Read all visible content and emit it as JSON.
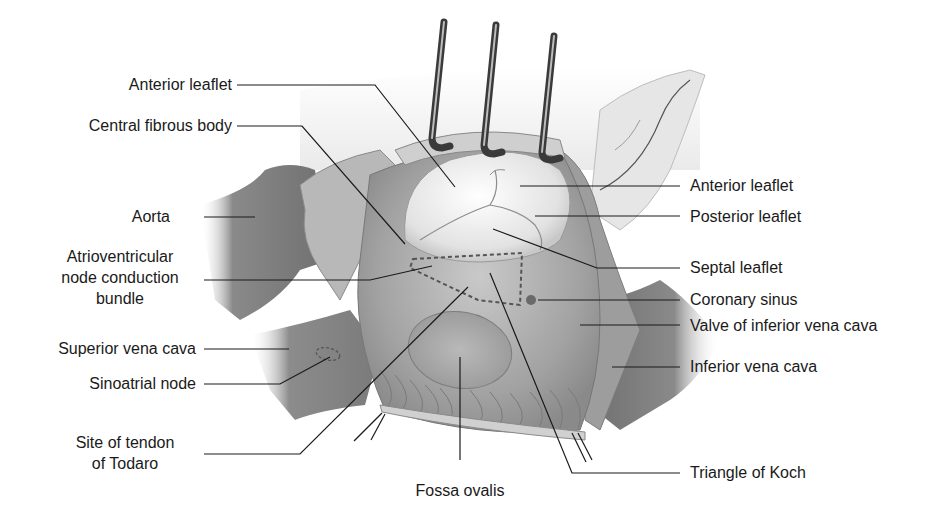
{
  "figure": {
    "labels_left": [
      {
        "id": "anterior-leaflet-left",
        "text": "Anterior leaflet"
      },
      {
        "id": "central-fibrous-body",
        "text": "Central fibrous body"
      },
      {
        "id": "aorta",
        "text": "Aorta"
      },
      {
        "id": "av-node",
        "lines": [
          "Atrioventricular",
          "node conduction",
          "bundle"
        ]
      },
      {
        "id": "superior-vena-cava",
        "text": "Superior vena cava"
      },
      {
        "id": "sinoatrial-node",
        "text": "Sinoatrial node"
      },
      {
        "id": "tendon-of-todaro",
        "lines": [
          "Site of tendon",
          "of Todaro"
        ]
      }
    ],
    "labels_right": [
      {
        "id": "anterior-leaflet-right",
        "text": "Anterior leaflet"
      },
      {
        "id": "posterior-leaflet",
        "text": "Posterior leaflet"
      },
      {
        "id": "septal-leaflet",
        "text": "Septal leaflet"
      },
      {
        "id": "coronary-sinus",
        "text": "Coronary sinus"
      },
      {
        "id": "valve-ivc",
        "text": "Valve of inferior vena cava"
      },
      {
        "id": "inferior-vena-cava",
        "text": "Inferior vena cava"
      },
      {
        "id": "triangle-of-koch",
        "text": "Triangle of Koch"
      }
    ],
    "labels_bottom": [
      {
        "id": "fossa-ovalis",
        "text": "Fossa ovalis"
      }
    ],
    "colors": {
      "background": "#ffffff",
      "tissue_dark": "#7a7a7a",
      "tissue_mid": "#a8a8a8",
      "tissue_light": "#d4d4d4",
      "leaflet": "#ececec",
      "leader_line": "#1a1a1a",
      "text": "#1a1a1a"
    }
  }
}
